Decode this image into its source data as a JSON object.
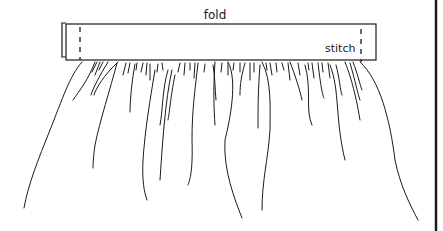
{
  "diagram": {
    "labels": {
      "fold": "fold",
      "stitch": "stitch"
    },
    "colors": {
      "ink": "#1a1a1a",
      "background": "#ffffff"
    },
    "parts": [
      "waistband",
      "stitch-lines",
      "gathered-fabric",
      "right-border"
    ]
  }
}
